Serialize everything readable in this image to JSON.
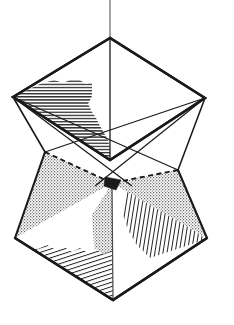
{
  "document": {
    "kind": "geometric-line-drawing",
    "title": "Two interpenetrating square pyramids on a vertical axis",
    "background_color": "#ffffff",
    "ink_color": "#1a1a1a",
    "width": 234,
    "height": 325
  },
  "figure": {
    "name": "interpenetrating-pyramids",
    "description": "Upper inverted square pyramid and lower upright square pyramid sharing a common vertical axis, drawn in parallel projection with hatched and stippled shading.",
    "axis": {
      "name": "vertical-axis-line",
      "style": "thin solid",
      "x": 110,
      "y_top": 0,
      "y_bottom": 103,
      "color": "#5a5a5a",
      "width": 1.1
    },
    "vertices": {
      "top_apex": {
        "label": "top-apex",
        "x": 110,
        "y": 38
      },
      "upper_left": {
        "label": "upper-left",
        "x": 13,
        "y": 97
      },
      "upper_right": {
        "label": "upper-right",
        "x": 205,
        "y": 98
      },
      "upper_front": {
        "label": "upper-front-center",
        "x": 110,
        "y": 160
      },
      "center_node": {
        "label": "center-node",
        "x": 112,
        "y": 183
      },
      "lower_left": {
        "label": "lower-left",
        "x": 15,
        "y": 238
      },
      "lower_right": {
        "label": "lower-right",
        "x": 207,
        "y": 238
      },
      "bottom_apex": {
        "label": "bottom-apex",
        "x": 113,
        "y": 300
      },
      "left_wing": {
        "label": "left-wing",
        "x": 45,
        "y": 152
      },
      "right_wing": {
        "label": "right-wing",
        "x": 178,
        "y": 170
      }
    },
    "faces": [
      {
        "name": "upper-left-face",
        "shading": "horizontal-hatch",
        "shading_label": "Horizontal line hatching",
        "color": "#1a1a1a"
      },
      {
        "name": "upper-right-face",
        "shading": "none",
        "shading_label": "Unshaded white",
        "color": "#ffffff"
      },
      {
        "name": "lower-left-stipple-face",
        "shading": "stipple",
        "shading_label": "Stipple / dotted grey",
        "color": "#b4b4b4"
      },
      {
        "name": "lower-center-stipple-face",
        "shading": "stipple",
        "shading_label": "Stipple / dotted grey",
        "color": "#b4b4b4"
      },
      {
        "name": "lower-right-stipple-face",
        "shading": "stipple",
        "shading_label": "Stipple / dotted grey",
        "color": "#b4b4b4"
      },
      {
        "name": "bottom-left-hatch-face",
        "shading": "diagonal-hatch",
        "shading_label": "Diagonal line hatching",
        "color": "#1a1a1a"
      },
      {
        "name": "bottom-right-hatch-face",
        "shading": "vertical-hatch",
        "shading_label": "Near-vertical line hatching",
        "color": "#1a1a1a"
      }
    ],
    "hidden_edges": [
      {
        "name": "hidden-edge-left",
        "style": "dashed"
      },
      {
        "name": "hidden-edge-right",
        "style": "dashed"
      }
    ],
    "stroke": {
      "outline_width": 2.4,
      "interior_width": 1.3,
      "hatch_width": 0.9,
      "dash_pattern": "5,3.5"
    }
  }
}
